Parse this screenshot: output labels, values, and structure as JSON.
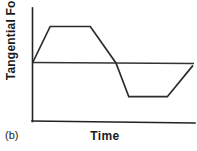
{
  "figure": {
    "panel_label": "(b)",
    "background_color": "#ffffff",
    "line_color": "#2b2b2b",
    "axis_color": "#222222"
  },
  "chart_data": {
    "type": "line",
    "title": "",
    "subtitle": "",
    "xlabel": "Time",
    "ylabel": "Tangential Force",
    "annotations": [
      "(b)"
    ],
    "legend": [],
    "legend_position": "none",
    "grid": false,
    "axis_ticks": {
      "x": [],
      "y": []
    },
    "xlim": [
      0,
      1
    ],
    "ylim": [
      -1.15,
      1.15
    ],
    "zero_reference_line": 0,
    "series": [
      {
        "name": "Tangential Force",
        "x": [
          0.0,
          0.11,
          0.36,
          0.52,
          0.6,
          0.84,
          1.0
        ],
        "y": [
          0.0,
          0.78,
          0.78,
          0.0,
          -0.72,
          -0.72,
          -0.05
        ],
        "description": "Trapezoidal waveform: rises from zero to a positive plateau, descends through zero to a negative plateau, then rises back toward zero."
      }
    ]
  }
}
